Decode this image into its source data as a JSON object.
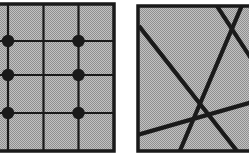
{
  "figure": {
    "title": "",
    "background_color": "#ffffff",
    "fill_color": "#b4b4b4",
    "stroke_color": "#1a1a1a",
    "panels": [
      {
        "name": "grid-panel",
        "label": "",
        "box": {
          "x": -8,
          "y": 4,
          "width": 122,
          "height": 147
        },
        "border_width": 3.5,
        "grid": {
          "vertical_lines_x": [
            8,
            43.5,
            78.5
          ],
          "horizontal_lines_y": [
            41,
            75,
            113
          ],
          "line_width": 2.2
        },
        "points": [
          {
            "x": 8,
            "y": 41
          },
          {
            "x": 78.5,
            "y": 41
          },
          {
            "x": 8,
            "y": 75
          },
          {
            "x": 78.5,
            "y": 75
          },
          {
            "x": 8,
            "y": 113
          },
          {
            "x": 78.5,
            "y": 113
          }
        ],
        "point_radius": 6.2
      },
      {
        "name": "lines-panel",
        "label": "",
        "box": {
          "x": 138,
          "y": 6,
          "width": 118,
          "height": 145
        },
        "border_width": 3.5,
        "segments": [
          {
            "name": "segment-1",
            "x1": 139,
            "y1": 26,
            "x2": 244,
            "y2": 160,
            "width": 4.2
          },
          {
            "name": "segment-2",
            "x1": 243,
            "y1": 3,
            "x2": 176,
            "y2": 160,
            "width": 4.2
          },
          {
            "name": "segment-3",
            "x1": 215,
            "y1": 3,
            "x2": 256,
            "y2": 66,
            "width": 4.2
          },
          {
            "name": "segment-4",
            "x1": 137,
            "y1": 135,
            "x2": 256,
            "y2": 101,
            "width": 4.2
          }
        ]
      }
    ]
  }
}
